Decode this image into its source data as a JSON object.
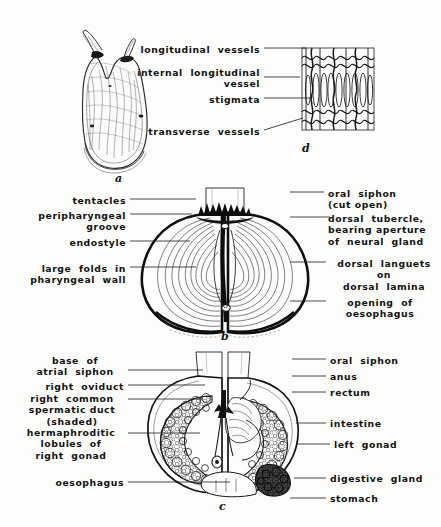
{
  "figure": {
    "caption_letters": {
      "a": "a",
      "b": "b",
      "c": "c",
      "d": "d"
    }
  },
  "panel_d": {
    "letter": "d",
    "labels": [
      {
        "id": "longitudinal-vessels",
        "text": "longitudinal  vessels",
        "align": "right",
        "x": 260,
        "y": 44,
        "line": {
          "x1": 264,
          "y1": 48,
          "x2": 306,
          "y2": 48
        }
      },
      {
        "id": "internal-longitudinal-vessel",
        "text": "internal  longitudinal\nvessel",
        "align": "right",
        "x": 260,
        "y": 67,
        "line": {
          "x1": 264,
          "y1": 77,
          "x2": 300,
          "y2": 77
        }
      },
      {
        "id": "stigmata",
        "text": "stigmata",
        "align": "right",
        "x": 260,
        "y": 94,
        "line": {
          "x1": 264,
          "y1": 98,
          "x2": 311,
          "y2": 98
        }
      },
      {
        "id": "transverse-vessels",
        "text": "transverse  vessels",
        "align": "right",
        "x": 260,
        "y": 126,
        "line": {
          "x1": 264,
          "y1": 130,
          "x2": 303,
          "y2": 118
        }
      }
    ]
  },
  "panel_a": {
    "letter": "a"
  },
  "panel_b": {
    "letter": "b",
    "left_labels": [
      {
        "id": "tentacles",
        "text": "tentacles",
        "x": 126,
        "y": 195,
        "line": {
          "x1": 130,
          "y1": 199,
          "x2": 196,
          "y2": 199
        }
      },
      {
        "id": "peripharyngeal-groove",
        "text": "peripharyngeal\ngroove",
        "x": 126,
        "y": 210,
        "line": {
          "x1": 130,
          "y1": 214,
          "x2": 192,
          "y2": 214
        }
      },
      {
        "id": "endostyle",
        "text": "endostyle",
        "x": 126,
        "y": 237,
        "line": {
          "x1": 130,
          "y1": 241,
          "x2": 190,
          "y2": 241
        }
      },
      {
        "id": "large-folds-in-pharyngeal-wall",
        "text": "large  folds  in\npharyngeal  wall",
        "x": 126,
        "y": 263,
        "line": {
          "x1": 130,
          "y1": 267,
          "x2": 196,
          "y2": 267
        }
      }
    ],
    "right_labels": [
      {
        "id": "oral-siphon-cut-open",
        "text": "oral  siphon\n(cut open)",
        "x": 328,
        "y": 188,
        "line": {
          "x1": 290,
          "y1": 192,
          "x2": 324,
          "y2": 192
        }
      },
      {
        "id": "dorsal-tubercle",
        "text": "dorsal  tubercle,\nbearing aperture\nof  neural  gland",
        "x": 334,
        "y": 213,
        "line": {
          "x1": 290,
          "y1": 217,
          "x2": 330,
          "y2": 217
        }
      },
      {
        "id": "dorsal-languets",
        "text": "dorsal  languets\non\ndorsal  lamina",
        "x": 330,
        "y": 258,
        "line": {
          "x1": 290,
          "y1": 262,
          "x2": 326,
          "y2": 262
        }
      },
      {
        "id": "opening-of-oesophagus",
        "text": "opening  of\noesophagus",
        "x": 330,
        "y": 297,
        "line": {
          "x1": 290,
          "y1": 301,
          "x2": 326,
          "y2": 301
        }
      }
    ]
  },
  "panel_c": {
    "letter": "c",
    "left_labels": [
      {
        "id": "base-of-atrial-siphon",
        "text": "base  of\natrial  siphon",
        "x": 124,
        "y": 355,
        "line": {
          "x1": 128,
          "y1": 370,
          "x2": 203,
          "y2": 370
        }
      },
      {
        "id": "right-oviduct",
        "text": "right  oviduct",
        "x": 124,
        "y": 381,
        "line": {
          "x1": 128,
          "y1": 385,
          "x2": 205,
          "y2": 385
        }
      },
      {
        "id": "right-common-spermatic-duct-shaded",
        "text": "right  common\nspermatic duct\n(shaded)",
        "x": 124,
        "y": 395,
        "line": {
          "x1": 128,
          "y1": 399,
          "x2": 203,
          "y2": 399
        }
      },
      {
        "id": "hermaphroditic-lobules-of-right-gonad",
        "text": "hermaphroditic\nlobules  of\nright  gonad",
        "x": 124,
        "y": 429,
        "line": {
          "x1": 128,
          "y1": 433,
          "x2": 200,
          "y2": 433
        }
      },
      {
        "id": "oesophagus",
        "text": "oesophagus",
        "x": 124,
        "y": 478,
        "line": {
          "x1": 128,
          "y1": 482,
          "x2": 230,
          "y2": 482
        }
      }
    ],
    "right_labels": [
      {
        "id": "oral-siphon",
        "text": "oral  siphon",
        "x": 330,
        "y": 355,
        "line": {
          "x1": 292,
          "y1": 359,
          "x2": 326,
          "y2": 359
        }
      },
      {
        "id": "anus",
        "text": "anus",
        "x": 330,
        "y": 372,
        "line": {
          "x1": 292,
          "y1": 376,
          "x2": 326,
          "y2": 376
        }
      },
      {
        "id": "rectum",
        "text": "rectum",
        "x": 330,
        "y": 388,
        "line": {
          "x1": 292,
          "y1": 392,
          "x2": 326,
          "y2": 392
        }
      },
      {
        "id": "intestine",
        "text": "intestine",
        "x": 330,
        "y": 419,
        "line": {
          "x1": 296,
          "y1": 423,
          "x2": 326,
          "y2": 423
        }
      },
      {
        "id": "left-gonad",
        "text": "left  gonad",
        "x": 334,
        "y": 440,
        "line": {
          "x1": 296,
          "y1": 444,
          "x2": 330,
          "y2": 444
        }
      },
      {
        "id": "digestive-gland",
        "text": "digestive  gland",
        "x": 330,
        "y": 474,
        "line": {
          "x1": 294,
          "y1": 478,
          "x2": 326,
          "y2": 478
        }
      },
      {
        "id": "stomach",
        "text": "stomach",
        "x": 330,
        "y": 494,
        "line": {
          "x1": 290,
          "y1": 498,
          "x2": 326,
          "y2": 498
        }
      }
    ]
  },
  "colors": {
    "ink": "#111111",
    "background": "#fdfdfb",
    "line": "#1a1a1a"
  }
}
